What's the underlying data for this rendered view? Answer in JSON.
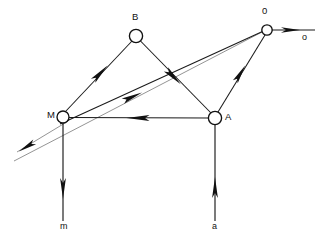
{
  "diagram": {
    "type": "kinematic-linkage-vector-diagram",
    "background_color": "#ffffff",
    "stroke_color": "#111111",
    "faint_stroke_color": "#8e8e8e",
    "node_fill": "#ffffff",
    "nodes": [
      {
        "id": "B",
        "label": "B",
        "cx": 136,
        "cy": 36,
        "r": 6.6
      },
      {
        "id": "O",
        "label": "0",
        "cx": 267,
        "cy": 30,
        "r": 5.2
      },
      {
        "id": "M",
        "label": "M",
        "cx": 63,
        "cy": 117,
        "r": 6.0
      },
      {
        "id": "A",
        "label": "A",
        "cx": 215,
        "cy": 118,
        "r": 6.6
      }
    ],
    "axis_labels": [
      {
        "id": "o",
        "label": "o",
        "x": 302,
        "y": 33
      },
      {
        "id": "m",
        "label": "m",
        "x": 60,
        "y": 222
      },
      {
        "id": "a",
        "label": "a",
        "x": 212,
        "y": 222
      }
    ],
    "edges": [
      {
        "id": "M-B",
        "from": "M",
        "to": "B",
        "arrow": "toward-B",
        "arrow_at": [
          100,
          73
        ]
      },
      {
        "id": "B-A",
        "from": "B",
        "to": "A",
        "arrow": "toward-A",
        "arrow_at": [
          172,
          78
        ]
      },
      {
        "id": "A-M",
        "from": "A",
        "to": "M",
        "arrow": "toward-M",
        "arrow_at": [
          140,
          118
        ]
      },
      {
        "id": "A-O",
        "from": "A",
        "to": "O",
        "arrow": "toward-O",
        "arrow_at": [
          240,
          73
        ]
      },
      {
        "id": "diag-to-O",
        "from": "lower-left",
        "to": "O",
        "arrow": "toward-O",
        "arrow_at": [
          133,
          96
        ]
      },
      {
        "id": "diag-from-M",
        "from": "M",
        "to": "lower-left",
        "arrow": "toward-lower-left",
        "arrow_at": [
          26,
          147
        ]
      },
      {
        "id": "O-o-axis",
        "from": "O",
        "to": "o",
        "arrow": "toward-o",
        "arrow_at": [
          292,
          30
        ]
      },
      {
        "id": "M-m-axis",
        "from": "M",
        "to": "m",
        "arrow": "downward",
        "arrow_at": [
          63,
          188
        ]
      },
      {
        "id": "A-a-axis",
        "from": "a",
        "to": "A",
        "arrow": "upward",
        "arrow_at": [
          215,
          188
        ]
      }
    ]
  }
}
